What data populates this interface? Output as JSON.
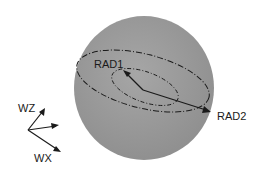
{
  "diagram": {
    "type": "sphere-with-orbits",
    "labels": {
      "rad1": "RAD1",
      "rad2": "RAD2",
      "wz": "WZ",
      "wx": "WX"
    },
    "colors": {
      "sphere": "#9a9a9a",
      "line": "#1a1a1a",
      "background": "#ffffff"
    }
  }
}
